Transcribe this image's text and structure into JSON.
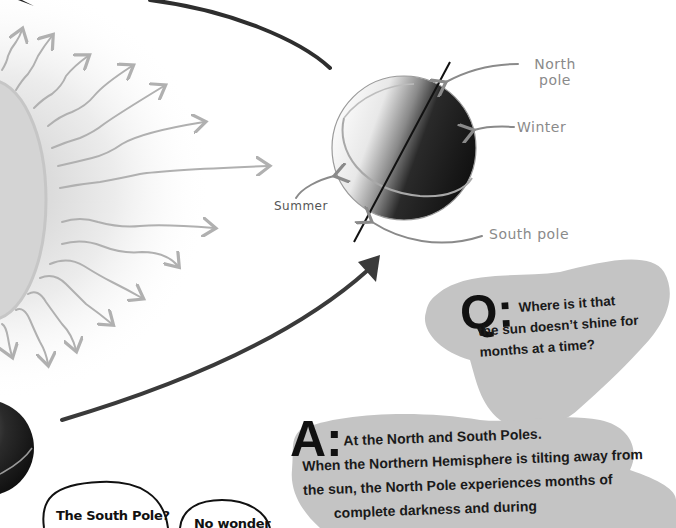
{
  "diagram": {
    "labels": {
      "north_pole": [
        "North",
        "pole"
      ],
      "winter": "Winter",
      "summer": "Summer",
      "south_pole": "South pole"
    }
  },
  "qa": {
    "question": {
      "marker": "Q:",
      "line1": "Where is it that",
      "line2": "the sun doesn’t shine for",
      "line3": "months at a time?"
    },
    "answer": {
      "marker": "A:",
      "line1": "At the North and South Poles.",
      "line2": "When the Northern Hemisphere is tilting away from",
      "line3": "the sun, the North Pole experiences months of",
      "line4": "complete darkness and during"
    }
  },
  "speech_bubbles": [
    {
      "text": "The South Pole?"
    },
    {
      "text": "No wonder"
    }
  ],
  "colors": {
    "blob_gray": "#c4c4c4",
    "ink": "#111111",
    "label_gray": "#8a8a8a",
    "orbit_arrow": "#3a3a3a",
    "sun_ray": "#b0b0b0"
  }
}
